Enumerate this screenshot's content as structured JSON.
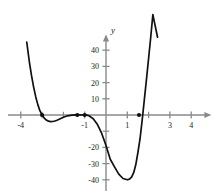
{
  "chart_data": {
    "type": "line",
    "title": "",
    "subtitle": "",
    "xlabel": "x",
    "ylabel": "y",
    "grid": false,
    "legend": null,
    "xlim": [
      -4.6,
      4.9
    ],
    "ylim": [
      -47,
      49
    ],
    "x_ticks": [
      -4,
      -1,
      1,
      3,
      4
    ],
    "x_tick_labels": [
      "-4",
      "-1",
      "1",
      "3",
      "4"
    ],
    "x_minor_ticks": [
      -3,
      -2,
      0,
      2
    ],
    "y_ticks": [
      10,
      20,
      30,
      40,
      -20,
      -30,
      -40
    ],
    "y_tick_labels": [
      "10",
      "20",
      "30",
      "40",
      "-20",
      "-30",
      "-40"
    ],
    "y_unlabeled_ticks": [
      -10
    ],
    "series": [
      {
        "name": "curve",
        "equation": "y = 5(x+3)(x+1)^2(x-1.5)",
        "x_start": -3.72,
        "x_end": 2.42,
        "points": [
          [
            -3.72,
            45.0
          ],
          [
            -3.6,
            33.0
          ],
          [
            -3.5,
            24.6
          ],
          [
            -3.4,
            17.4
          ],
          [
            -3.3,
            11.3
          ],
          [
            -3.2,
            6.4
          ],
          [
            -3.1,
            2.5
          ],
          [
            -3.0,
            0.0
          ],
          [
            -2.9,
            -1.9
          ],
          [
            -2.8,
            -3.1
          ],
          [
            -2.7,
            -3.8
          ],
          [
            -2.6,
            -4.1
          ],
          [
            -2.5,
            -4.0
          ],
          [
            -2.4,
            -3.7
          ],
          [
            -2.3,
            -3.2
          ],
          [
            -2.2,
            -2.6
          ],
          [
            -2.1,
            -2.0
          ],
          [
            -2.0,
            -1.4
          ],
          [
            -1.8,
            -0.5
          ],
          [
            -1.6,
            -0.1
          ],
          [
            -1.4,
            0.1
          ],
          [
            -1.2,
            0.15
          ],
          [
            -1.0,
            0.0
          ],
          [
            -0.9,
            -0.1
          ],
          [
            -0.8,
            -0.5
          ],
          [
            -0.6,
            -2.3
          ],
          [
            -0.4,
            -5.9
          ],
          [
            -0.2,
            -11.4
          ],
          [
            0.0,
            -18.8
          ],
          [
            0.2,
            -27.3
          ],
          [
            0.4,
            -32.0
          ],
          [
            0.6,
            -36.5
          ],
          [
            0.8,
            -39.2
          ],
          [
            1.0,
            -40.0
          ],
          [
            1.1,
            -39.6
          ],
          [
            1.2,
            -38.4
          ],
          [
            1.3,
            -35.6
          ],
          [
            1.4,
            -30.6
          ],
          [
            1.5,
            -23.0
          ],
          [
            1.6,
            -14.5
          ],
          [
            1.7,
            -3.0
          ],
          [
            1.8,
            9.5
          ],
          [
            1.9,
            22.0
          ],
          [
            2.0,
            35.0
          ],
          [
            2.1,
            48.0
          ],
          [
            2.2,
            62.0
          ],
          [
            2.42,
            48.0
          ]
        ]
      }
    ],
    "marked_points": [
      {
        "name": "root-left",
        "x": -3.0,
        "y": 0
      },
      {
        "name": "root-double-left",
        "x": -1.35,
        "y": 0
      },
      {
        "name": "root-double",
        "x": -1.0,
        "y": 0
      },
      {
        "name": "root-right",
        "x": 1.55,
        "y": 0
      }
    ],
    "colors": {
      "curve": "#111111",
      "axis": "#8a8a8a",
      "text": "#1a1a1a",
      "background": "#ffffff",
      "marker": "#111111"
    }
  }
}
